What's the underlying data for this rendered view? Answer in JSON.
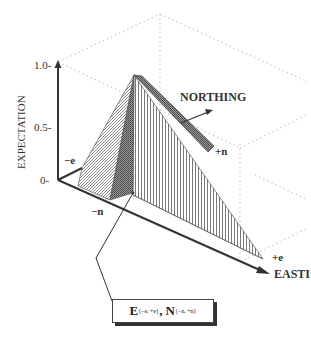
{
  "figure": {
    "y_axis": {
      "label": "EXPECTATION",
      "ticks": [
        "1.0-",
        "0.5-",
        "0-"
      ]
    },
    "axes": {
      "northing_label": "NORTHING",
      "easting_label": "EASTI"
    },
    "corner_labels": {
      "neg_e": "−e",
      "pos_e": "+e",
      "neg_n": "−n",
      "pos_n": "+n"
    },
    "legend": {
      "e_symbol": "E",
      "e_range": "(−e, +e)",
      "separator": ",",
      "n_symbol": "N",
      "n_range": "(−n, +n)"
    },
    "colors": {
      "ink": "#333333",
      "grid": "#bbbbbb",
      "background": "#ffffff"
    }
  }
}
